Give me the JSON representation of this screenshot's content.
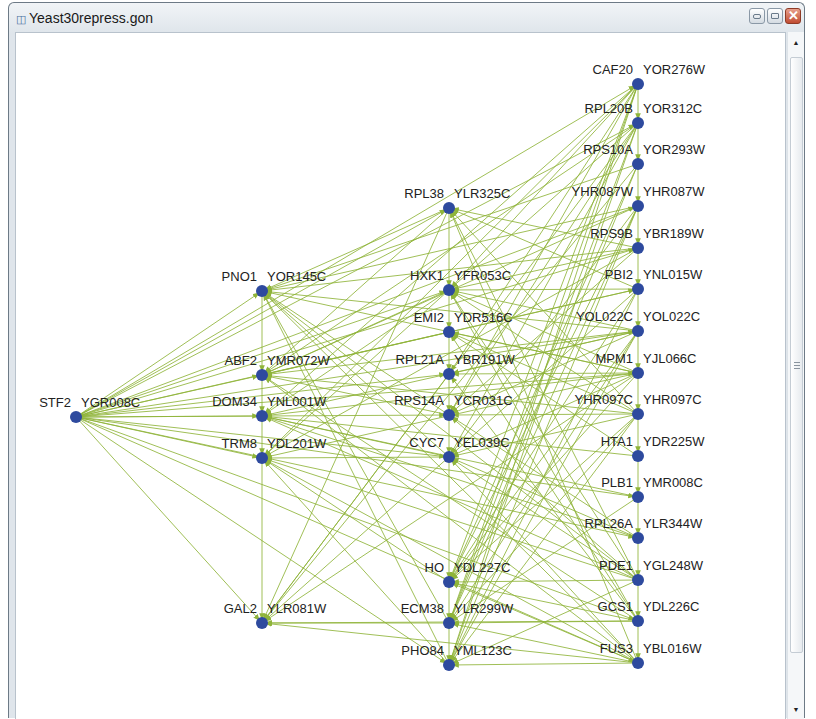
{
  "window": {
    "title": "Yeast30repress.gon",
    "controls": [
      "minimize",
      "maximize",
      "close"
    ]
  },
  "graph": {
    "edge_color": "#8fb43a",
    "node_color": "#2e4a9e",
    "nodes": [
      {
        "id": "STF2",
        "orf": "YGR008C",
        "x": 76,
        "y": 417
      },
      {
        "id": "PNO1",
        "orf": "YOR145C",
        "x": 262,
        "y": 291
      },
      {
        "id": "ABF2",
        "orf": "YMR072W",
        "x": 262,
        "y": 375
      },
      {
        "id": "DOM34",
        "orf": "YNL001W",
        "x": 262,
        "y": 416
      },
      {
        "id": "TRM8",
        "orf": "YDL201W",
        "x": 262,
        "y": 458
      },
      {
        "id": "GAL2",
        "orf": "YLR081W",
        "x": 262,
        "y": 623
      },
      {
        "id": "RPL38",
        "orf": "YLR325C",
        "x": 449,
        "y": 208
      },
      {
        "id": "HXK1",
        "orf": "YFR053C",
        "x": 449,
        "y": 290
      },
      {
        "id": "EMI2",
        "orf": "YDR516C",
        "x": 449,
        "y": 332
      },
      {
        "id": "RPL21A",
        "orf": "YBR191W",
        "x": 449,
        "y": 374
      },
      {
        "id": "RPS14A",
        "orf": "YCR031C",
        "x": 449,
        "y": 415
      },
      {
        "id": "CYC7",
        "orf": "YEL039C",
        "x": 449,
        "y": 457
      },
      {
        "id": "HO",
        "orf": "YDL227C",
        "x": 449,
        "y": 582
      },
      {
        "id": "ECM38",
        "orf": "YLR299W",
        "x": 449,
        "y": 623
      },
      {
        "id": "PHO84",
        "orf": "YML123C",
        "x": 449,
        "y": 665
      },
      {
        "id": "CAF20",
        "orf": "YOR276W",
        "x": 638,
        "y": 84
      },
      {
        "id": "RPL20B",
        "orf": "YOR312C",
        "x": 638,
        "y": 123
      },
      {
        "id": "RPS10A",
        "orf": "YOR293W",
        "x": 638,
        "y": 164
      },
      {
        "id": "YHR087W",
        "orf": "YHR087W",
        "x": 638,
        "y": 206
      },
      {
        "id": "RPS9B",
        "orf": "YBR189W",
        "x": 638,
        "y": 248
      },
      {
        "id": "PBI2",
        "orf": "YNL015W",
        "x": 638,
        "y": 289
      },
      {
        "id": "YOL022C",
        "orf": "YOL022C",
        "x": 638,
        "y": 331
      },
      {
        "id": "MPM1",
        "orf": "YJL066C",
        "x": 638,
        "y": 373
      },
      {
        "id": "YHR097C",
        "orf": "YHR097C",
        "x": 638,
        "y": 414
      },
      {
        "id": "HTA1",
        "orf": "YDR225W",
        "x": 638,
        "y": 456
      },
      {
        "id": "PLB1",
        "orf": "YMR008C",
        "x": 638,
        "y": 497
      },
      {
        "id": "RPL26A",
        "orf": "YLR344W",
        "x": 638,
        "y": 538
      },
      {
        "id": "PDE1",
        "orf": "YGL248W",
        "x": 638,
        "y": 580
      },
      {
        "id": "GCS1",
        "orf": "YDL226C",
        "x": 638,
        "y": 621
      },
      {
        "id": "FUS3",
        "orf": "YBL016W",
        "x": 638,
        "y": 663
      }
    ]
  },
  "scrollbar": {
    "up_arrow": "▲",
    "down_arrow": "▼"
  }
}
